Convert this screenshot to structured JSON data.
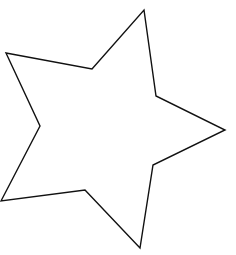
{
  "canvas": {
    "width": 236,
    "height": 255,
    "background": "#ffffff"
  },
  "shape": {
    "type": "five-pointed-star",
    "fill": "#ffffff",
    "stroke": "#111111",
    "stroke_width": 1.4,
    "points": "144,10 156,96 225,130 153,165 140,248 85,190 1,201 40,126 6,53 92,69"
  }
}
